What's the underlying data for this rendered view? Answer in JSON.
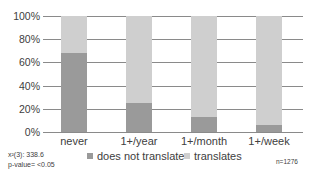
{
  "chart_data": {
    "type": "bar",
    "stacked": true,
    "categories": [
      "never",
      "1+/year",
      "1+/month",
      "1+/week"
    ],
    "series": [
      {
        "name": "does not translate",
        "values": [
          68,
          25,
          13,
          6
        ],
        "color": "#9a9a9a"
      },
      {
        "name": "translates",
        "values": [
          32,
          75,
          87,
          94
        ],
        "color": "#cfcfcf"
      }
    ],
    "ylim": [
      0,
      100
    ],
    "yticks": [
      "0%",
      "20%",
      "40%",
      "60%",
      "80%",
      "100%"
    ],
    "grid": true,
    "legend_position": "bottom",
    "annotations": {
      "chi_square": "x²(3): 338.6",
      "p_value": "p-value= <0.05",
      "n": "n=1276"
    }
  }
}
